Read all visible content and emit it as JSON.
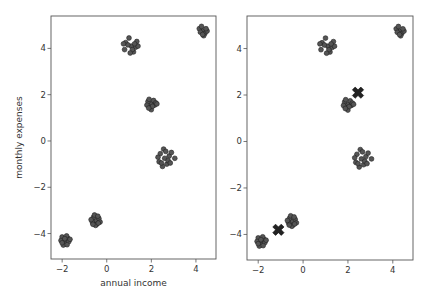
{
  "chart_data": [
    {
      "type": "scatter",
      "panel": "left",
      "title": "",
      "xlabel": "annual income",
      "ylabel": "monthly expenses",
      "xlim": [
        -2.5,
        4.9
      ],
      "ylim": [
        -5.1,
        5.4
      ],
      "xticks": [
        -2,
        0,
        2,
        4
      ],
      "xtick_labels": [
        "−2",
        "0",
        "2",
        "4"
      ],
      "yticks": [
        -4,
        -2,
        0,
        2,
        4
      ],
      "ytick_labels": [
        "−4",
        "−2",
        "0",
        "2",
        "4"
      ],
      "grid": false,
      "legend": null,
      "marker_color": "#555555",
      "marker_edge": "#222222",
      "series": [
        {
          "name": "cluster-1",
          "points": [
            [
              -1.9,
              -4.3
            ],
            [
              -1.75,
              -4.2
            ],
            [
              -2.0,
              -4.15
            ],
            [
              -1.85,
              -4.45
            ],
            [
              -1.7,
              -4.35
            ],
            [
              -2.05,
              -4.3
            ],
            [
              -1.95,
              -4.5
            ],
            [
              -1.8,
              -4.1
            ],
            [
              -1.65,
              -4.25
            ],
            [
              -2.0,
              -4.4
            ],
            [
              -1.88,
              -4.22
            ],
            [
              -1.78,
              -4.48
            ]
          ]
        },
        {
          "name": "cluster-2",
          "points": [
            [
              -0.5,
              -3.45
            ],
            [
              -0.35,
              -3.35
            ],
            [
              -0.6,
              -3.3
            ],
            [
              -0.45,
              -3.6
            ],
            [
              -0.3,
              -3.5
            ],
            [
              -0.65,
              -3.5
            ],
            [
              -0.55,
              -3.2
            ],
            [
              -0.4,
              -3.25
            ],
            [
              -0.7,
              -3.4
            ],
            [
              -0.5,
              -3.65
            ],
            [
              -0.38,
              -3.55
            ],
            [
              -0.62,
              -3.6
            ]
          ]
        },
        {
          "name": "cluster-3",
          "points": [
            [
              1.1,
              4.1
            ],
            [
              0.85,
              4.25
            ],
            [
              1.3,
              4.05
            ],
            [
              1.0,
              4.45
            ],
            [
              0.8,
              3.95
            ],
            [
              1.2,
              3.85
            ],
            [
              1.35,
              4.3
            ],
            [
              0.95,
              4.15
            ],
            [
              1.15,
              3.95
            ],
            [
              1.4,
              4.1
            ],
            [
              0.75,
              4.2
            ],
            [
              1.05,
              3.8
            ],
            [
              1.25,
              4.2
            ]
          ]
        },
        {
          "name": "cluster-4",
          "points": [
            [
              2.0,
              1.6
            ],
            [
              1.85,
              1.7
            ],
            [
              2.15,
              1.55
            ],
            [
              1.95,
              1.45
            ],
            [
              2.1,
              1.75
            ],
            [
              1.8,
              1.55
            ],
            [
              2.2,
              1.65
            ],
            [
              2.0,
              1.35
            ],
            [
              1.9,
              1.8
            ],
            [
              2.05,
              1.5
            ],
            [
              2.25,
              1.6
            ],
            [
              1.88,
              1.42
            ]
          ]
        },
        {
          "name": "cluster-5",
          "points": [
            [
              2.6,
              -0.75
            ],
            [
              2.4,
              -0.55
            ],
            [
              2.8,
              -0.65
            ],
            [
              2.55,
              -0.35
            ],
            [
              2.35,
              -0.9
            ],
            [
              2.7,
              -1.0
            ],
            [
              2.9,
              -0.5
            ],
            [
              2.5,
              -1.1
            ],
            [
              3.05,
              -0.75
            ],
            [
              2.3,
              -0.7
            ],
            [
              2.65,
              -0.45
            ],
            [
              2.75,
              -0.85
            ],
            [
              2.45,
              -0.95
            ],
            [
              2.85,
              -0.95
            ]
          ]
        },
        {
          "name": "cluster-6",
          "points": [
            [
              4.3,
              4.75
            ],
            [
              4.15,
              4.85
            ],
            [
              4.4,
              4.65
            ],
            [
              4.25,
              4.95
            ],
            [
              4.5,
              4.75
            ],
            [
              4.35,
              4.55
            ],
            [
              4.2,
              4.7
            ],
            [
              4.45,
              4.85
            ],
            [
              4.3,
              4.6
            ]
          ]
        }
      ]
    },
    {
      "type": "scatter",
      "panel": "right",
      "title": "",
      "xlabel": "",
      "ylabel": "",
      "xlim": [
        -2.5,
        4.9
      ],
      "ylim": [
        -5.1,
        5.4
      ],
      "xticks": [
        -2,
        0,
        2,
        4
      ],
      "xtick_labels": [
        "−2",
        "0",
        "2",
        "4"
      ],
      "yticks": [
        -4,
        -2,
        0,
        2,
        4
      ],
      "ytick_labels": [
        "−4",
        "−2",
        "0",
        "2",
        "4"
      ],
      "grid": false,
      "legend": null,
      "marker_color": "#555555",
      "marker_edge": "#222222",
      "centroid_color": "#222222",
      "centroids": [
        [
          2.45,
          2.1
        ],
        [
          -1.1,
          -3.8
        ]
      ],
      "series_ref": "same as left panel"
    }
  ]
}
